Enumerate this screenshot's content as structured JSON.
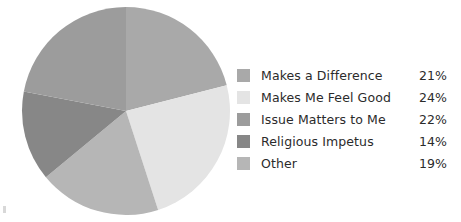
{
  "chart_data": {
    "type": "pie",
    "title": "",
    "subtitle": "",
    "xlabel": "",
    "ylabel": "",
    "grid": false,
    "legend_position": "right",
    "start_angle_deg": 0,
    "direction": "clockwise",
    "categories": [
      "Makes a Difference",
      "Makes Me Feel Good",
      "Issue Matters to Me",
      "Religious Impetus",
      "Other"
    ],
    "values": [
      21,
      24,
      22,
      14,
      19
    ],
    "value_labels": [
      "21%",
      "24%",
      "22%",
      "14%",
      "19%"
    ],
    "units": "percent",
    "total": 100,
    "colors": [
      "#a9a9a9",
      "#e4e4e4",
      "#9c9c9c",
      "#878787",
      "#b6b6b6"
    ],
    "slice_order_clockwise_from_top": [
      "Makes a Difference",
      "Makes Me Feel Good",
      "Other",
      "Religious Impetus",
      "Issue Matters to Me"
    ],
    "slices": [
      {
        "label": "Makes a Difference",
        "value": 21,
        "value_label": "21%",
        "color": "#a9a9a9"
      },
      {
        "label": "Makes Me Feel Good",
        "value": 24,
        "value_label": "24%",
        "color": "#e4e4e4"
      },
      {
        "label": "Issue Matters to Me",
        "value": 22,
        "value_label": "22%",
        "color": "#9c9c9c"
      },
      {
        "label": "Religious Impetus",
        "value": 14,
        "value_label": "14%",
        "color": "#878787"
      },
      {
        "label": "Other",
        "value": 19,
        "value_label": "19%",
        "color": "#b6b6b6"
      }
    ]
  },
  "legend": {
    "items": [
      {
        "label": "Makes a Difference",
        "value": "21%",
        "color": "#a9a9a9"
      },
      {
        "label": "Makes Me Feel Good",
        "value": "24%",
        "color": "#e4e4e4"
      },
      {
        "label": "Issue Matters to Me",
        "value": "22%",
        "color": "#9c9c9c"
      },
      {
        "label": "Religious Impetus",
        "value": "14%",
        "color": "#878787"
      },
      {
        "label": "Other",
        "value": "19%",
        "color": "#b6b6b6"
      }
    ]
  }
}
